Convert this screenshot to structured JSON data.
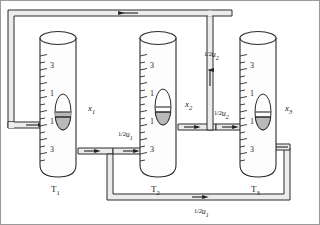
{
  "figure": {
    "type": "hydraulic-flow-diagram",
    "title_visible": false,
    "background": "#ffffff",
    "line_color": "#2b2b2b",
    "pipe_fill": "#e8e8e8",
    "float_fill": "#b8b8b8",
    "tube_fill": "#fdfdfd"
  },
  "tubes": [
    {
      "id": "T1",
      "name": "T",
      "subscript": "1",
      "position_label": "x",
      "position_subscript": "1",
      "scale_numbers": [
        "3",
        "1",
        "1",
        "3"
      ]
    },
    {
      "id": "T2",
      "name": "T",
      "subscript": "2",
      "position_label": "x",
      "position_subscript": "2",
      "scale_numbers": [
        "3",
        "1",
        "1",
        "3"
      ]
    },
    {
      "id": "T3",
      "name": "T",
      "subscript": "3",
      "position_label": "x",
      "position_subscript": "3",
      "scale_numbers": [
        "3",
        "1",
        "1",
        "3"
      ]
    }
  ],
  "flow_labels": [
    {
      "id": "u1-mid",
      "fraction": "1/2",
      "symbol": "u",
      "subscript": "1"
    },
    {
      "id": "u2-vert",
      "fraction": "1/2",
      "symbol": "u",
      "subscript": "2"
    },
    {
      "id": "u2-horiz",
      "fraction": "1/2",
      "symbol": "u",
      "subscript": "2"
    },
    {
      "id": "u1-bottom",
      "fraction": "1/2",
      "symbol": "u",
      "subscript": "1"
    }
  ],
  "flow_arrows": [
    {
      "id": "arrow-top",
      "direction": "left"
    },
    {
      "id": "arrow-left-inlet",
      "direction": "right"
    },
    {
      "id": "arrow-t1-outlet",
      "direction": "right"
    },
    {
      "id": "arrow-mid-pipe",
      "direction": "right"
    },
    {
      "id": "arrow-t2-outlet",
      "direction": "right"
    },
    {
      "id": "arrow-t2-to-t3",
      "direction": "right"
    },
    {
      "id": "arrow-riser-up",
      "direction": "up"
    },
    {
      "id": "arrow-bottom",
      "direction": "right"
    },
    {
      "id": "arrow-right-inlet",
      "direction": "left"
    }
  ]
}
